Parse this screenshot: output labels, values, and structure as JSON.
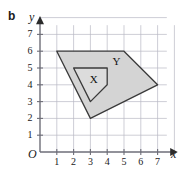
{
  "figure": {
    "part_label": "b",
    "axes": {
      "x_name": "x",
      "y_name": "y",
      "origin_label": "O",
      "x_ticks": [
        "1",
        "2",
        "3",
        "4",
        "5",
        "6",
        "7"
      ],
      "y_ticks": [
        "1",
        "2",
        "3",
        "4",
        "5",
        "6",
        "7"
      ],
      "x_range": [
        0,
        7.6
      ],
      "y_range": [
        0,
        7.6
      ],
      "grid": true,
      "grid_color": "#b9b9c4",
      "axis_color": "#6e6e78"
    },
    "shapes": [
      {
        "name": "Y",
        "label": "Y",
        "label_at": [
          4.55,
          5.35
        ],
        "vertices": [
          [
            1,
            6
          ],
          [
            5,
            6
          ],
          [
            7,
            4
          ],
          [
            3,
            2
          ]
        ],
        "fill": "#d4d4d4",
        "stroke": "#3a3a3a"
      },
      {
        "name": "X",
        "label": "X",
        "label_at": [
          3.2,
          4.3
        ],
        "vertices": [
          [
            2,
            5
          ],
          [
            4,
            5
          ],
          [
            4,
            4
          ],
          [
            3,
            3
          ]
        ],
        "fill": "#dcdcdc",
        "stroke": "#3a3a3a"
      }
    ]
  }
}
